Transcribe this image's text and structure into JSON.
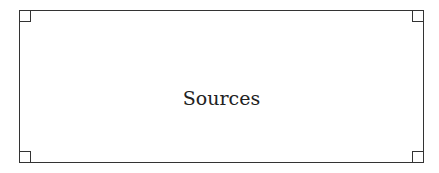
{
  "box": {
    "label": "Sources",
    "border_color": "#333333"
  }
}
